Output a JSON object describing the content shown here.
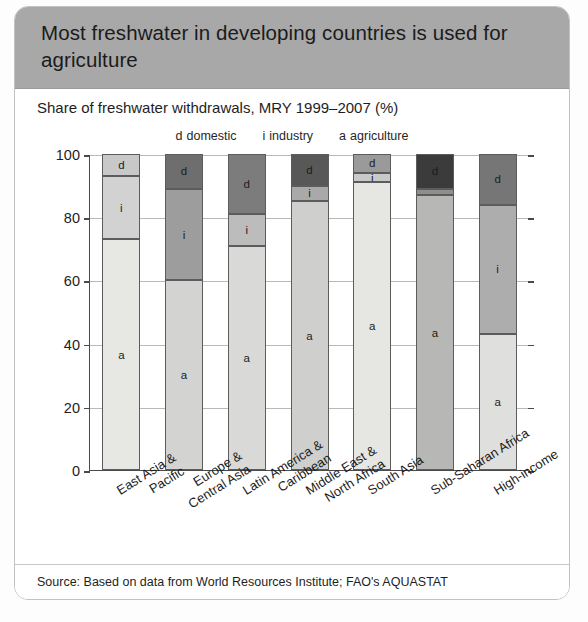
{
  "header": {
    "title": "Most freshwater in developing countries is used for agriculture",
    "background": "#a8a8a8"
  },
  "subtitle": "Share of freshwater withdrawals, MRY 1999–2007 (%)",
  "legend": [
    {
      "key": "d",
      "label": "domestic"
    },
    {
      "key": "i",
      "label": "industry"
    },
    {
      "key": "a",
      "label": "agriculture"
    }
  ],
  "source": "Source: Based on data from World Resources Institute; FAO's AQUASTAT",
  "chart_data": {
    "type": "bar",
    "stacked": true,
    "title": "Most freshwater in developing countries is used for agriculture",
    "subtitle": "Share of freshwater withdrawals, MRY 1999–2007 (%)",
    "xlabel": "",
    "ylabel": "",
    "ylim": [
      0,
      100
    ],
    "yticks": [
      0,
      20,
      40,
      60,
      80,
      100
    ],
    "grid": true,
    "legend_position": "top-center",
    "categories": [
      "East Asia & Pacific",
      "Europe & Central Asia",
      "Latin America & Caribbean",
      "Middle East & North Africa",
      "South Asia",
      "Sub-Saharan Africa",
      "High-income"
    ],
    "category_lines": [
      [
        "East Asia &",
        "Pacific"
      ],
      [
        "Europe &",
        "Central Asia"
      ],
      [
        "Latin America &",
        "Caribbean"
      ],
      [
        "Middle East &",
        "North Africa"
      ],
      [
        "South Asia"
      ],
      [
        "Sub-Saharan Africa"
      ],
      [
        "High-income"
      ]
    ],
    "series": [
      {
        "name": "agriculture",
        "key": "a",
        "values": [
          73,
          60,
          71,
          85,
          91,
          87,
          43
        ]
      },
      {
        "name": "industry",
        "key": "i",
        "values": [
          20,
          29,
          10,
          5,
          3,
          2,
          41
        ]
      },
      {
        "name": "domestic",
        "key": "d",
        "values": [
          7,
          11,
          19,
          10,
          6,
          11,
          16
        ]
      }
    ],
    "bar_colors": [
      {
        "category": "East Asia & Pacific",
        "a": "#e7e7e4",
        "i": "#d2d2d2",
        "d": "#c8c8c8"
      },
      {
        "category": "Europe & Central Asia",
        "a": "#d3d3d1",
        "i": "#9d9d9d",
        "d": "#6e6e6e"
      },
      {
        "category": "Latin America & Caribbean",
        "a": "#d9d9d7",
        "i": "#bcbcbc",
        "d": "#7c7c7c"
      },
      {
        "category": "Middle East & North Africa",
        "a": "#cfcfcd",
        "i": "#a9a9a9",
        "d": "#585858"
      },
      {
        "category": "South Asia",
        "a": "#e6e6e3",
        "i": "#c9c9c9",
        "d": "#9a9a9a"
      },
      {
        "category": "Sub-Saharan Africa",
        "a": "#b7b7b5",
        "i": "#8e8e8e",
        "d": "#3b3b3b"
      },
      {
        "category": "High-income",
        "a": "#dfdfdd",
        "i": "#adadad",
        "d": "#767676"
      }
    ]
  }
}
